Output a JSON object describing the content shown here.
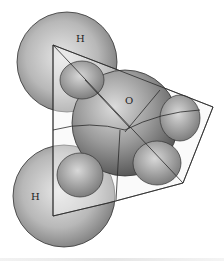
{
  "diagram": {
    "atoms": [
      {
        "label": "H",
        "role": "hydrogen-top"
      },
      {
        "label": "O",
        "role": "oxygen-center"
      },
      {
        "label": "H",
        "role": "hydrogen-bottom"
      }
    ],
    "colors": {
      "sphere_light": "#e0e0e0",
      "sphere_dark": "#6e6e6e",
      "outline": "#333333",
      "background": "#ffffff"
    }
  }
}
